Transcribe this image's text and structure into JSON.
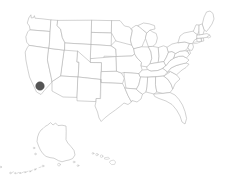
{
  "figure": {
    "kind": "choropleth-locator-map",
    "title": "",
    "background_color": "#ffffff",
    "width": 237,
    "height": 183
  },
  "style": {
    "state_outline_color": "#b4b4b4",
    "state_fill_color": "#ffffff",
    "island_outline_color": "#bdbdbd",
    "highlight_fill_color": "#555555",
    "highlight_stroke_color": "#454545",
    "outline_width_px": 0.6
  },
  "map": {
    "region_label": "United States",
    "projection_hint": "albers-usa",
    "insets": [
      {
        "name": "alaska-inset",
        "label": ""
      },
      {
        "name": "hawaii-inset",
        "label": ""
      }
    ]
  },
  "highlights": [
    {
      "name": "highlighted-county-marker",
      "label": "",
      "state": "California",
      "x": 40.0,
      "y": 86.0,
      "radius": 4.3,
      "color": "#555555"
    }
  ],
  "legend": {
    "visible": false,
    "entries": []
  },
  "annotations": [],
  "chart_data": {
    "type": "map",
    "title": "",
    "xlabel": "",
    "ylabel": "",
    "series": [
      {
        "name": "highlighted-location",
        "values": [
          {
            "state": "California",
            "x": 40.0,
            "y": 86.0,
            "value": 1
          }
        ]
      }
    ],
    "legend_position": "none",
    "grid": false
  }
}
